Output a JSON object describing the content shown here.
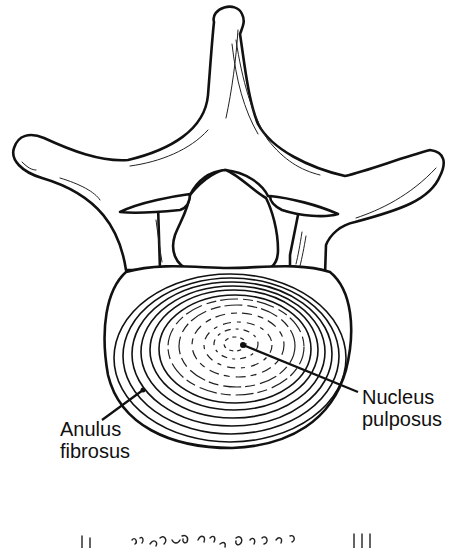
{
  "figure": {
    "labels": {
      "nucleus": "Nucleus\npulposus",
      "nucleus_line1": "Nucleus",
      "nucleus_line2": "pulposus",
      "anulus_line1": "Anulus",
      "anulus_line2": "fibrosus"
    },
    "colors": {
      "ink": "#111111",
      "background": "#ffffff"
    }
  }
}
